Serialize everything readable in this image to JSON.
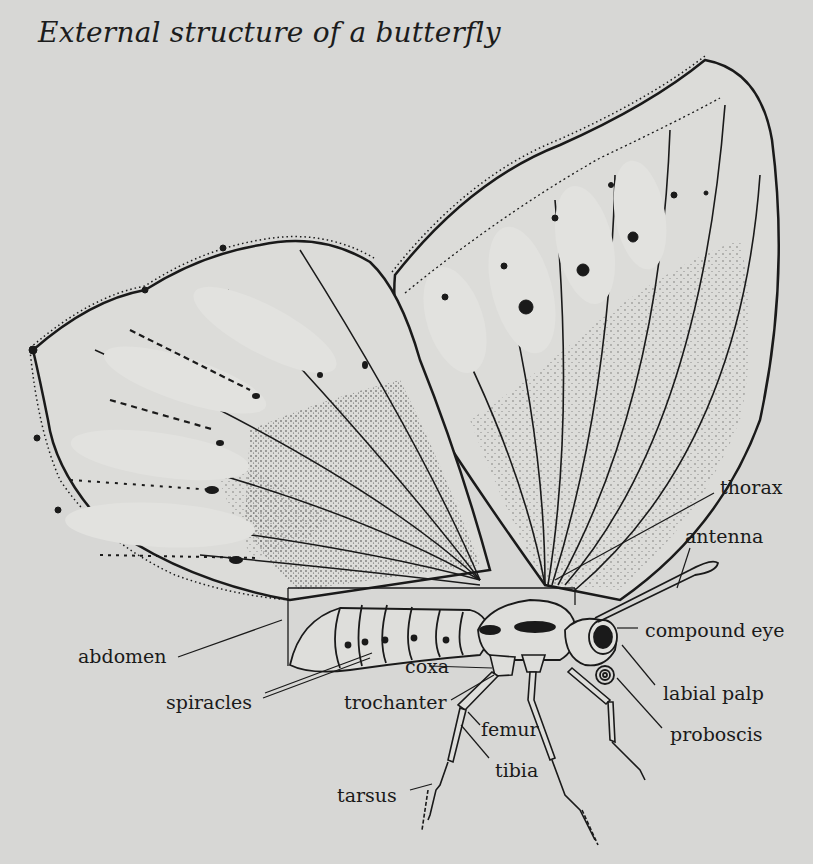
{
  "title": "External structure of a butterfly",
  "colors": {
    "background": "#d7d7d5",
    "ink": "#1a1a1a",
    "wing_fill": "#dcdcd9"
  },
  "labels": {
    "thorax": "thorax",
    "antenna": "antenna",
    "compound_eye": "compound eye",
    "labial_palp": "labial palp",
    "proboscis": "proboscis",
    "abdomen": "abdomen",
    "spiracles": "spiracles",
    "coxa": "coxa",
    "trochanter": "trochanter",
    "femur": "femur",
    "tibia": "tibia",
    "tarsus": "tarsus"
  }
}
